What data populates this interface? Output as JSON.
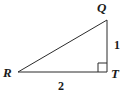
{
  "figure": {
    "background_color": "#ffffff",
    "stroke_color": "#2b2b2b",
    "stroke_width": 1
  },
  "vertices": [
    {
      "name": "Q",
      "label": "Q",
      "x": 107,
      "y": 20
    },
    {
      "name": "R",
      "label": "R",
      "x": 18,
      "y": 72
    },
    {
      "name": "T",
      "label": "T",
      "x": 107,
      "y": 72
    }
  ],
  "side_labels": [
    {
      "name": "QT",
      "label": "1",
      "position": "right"
    },
    {
      "name": "RT",
      "label": "2",
      "position": "bottom"
    }
  ],
  "right_angle": {
    "at_vertex": "T",
    "marker_size": 9
  },
  "chart_data": {
    "type": "diagram",
    "shape": "right triangle",
    "vertices": [
      "Q",
      "R",
      "T"
    ],
    "legs": [
      {
        "between": [
          "Q",
          "T"
        ],
        "length": 1
      },
      {
        "between": [
          "R",
          "T"
        ],
        "length": 2
      }
    ],
    "hypotenuse": {
      "between": [
        "R",
        "Q"
      ]
    },
    "right_angle_at": "T"
  }
}
